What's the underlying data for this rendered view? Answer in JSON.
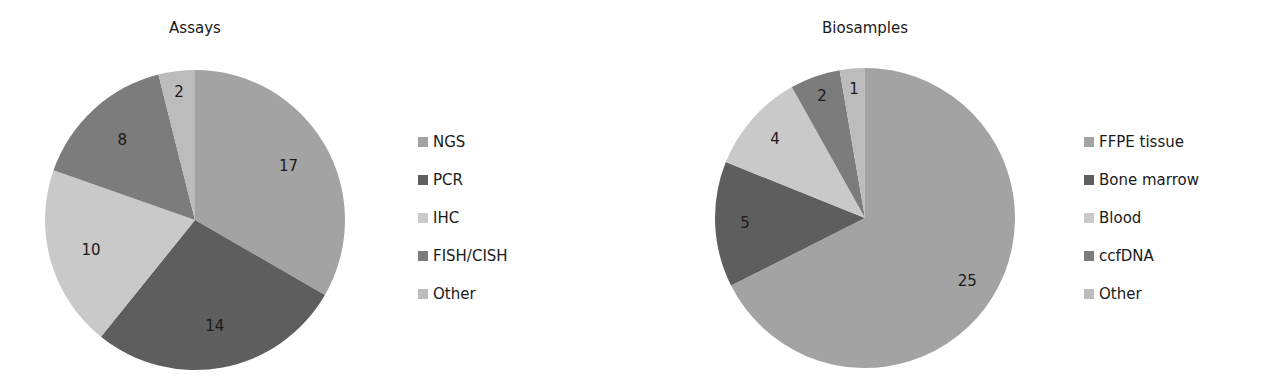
{
  "chart_data": [
    {
      "type": "pie",
      "title": "Assays",
      "categories": [
        "NGS",
        "PCR",
        "IHC",
        "FISH/CISH",
        "Other"
      ],
      "values": [
        17,
        14,
        10,
        8,
        2
      ],
      "colors": [
        "#a3a3a3",
        "#5e5e5e",
        "#c9c9c9",
        "#7c7c7c",
        "#bcbcbc"
      ],
      "start_angle_deg": 0,
      "direction": "clockwise",
      "data_labels": true,
      "legend_position": "right"
    },
    {
      "type": "pie",
      "title": "Biosamples",
      "categories": [
        "FFPE tissue",
        "Bone marrow",
        "Blood",
        "ccfDNA",
        "Other"
      ],
      "values": [
        25,
        5,
        4,
        2,
        1
      ],
      "colors": [
        "#a3a3a3",
        "#5e5e5e",
        "#c9c9c9",
        "#7c7c7c",
        "#bcbcbc"
      ],
      "start_angle_deg": 0,
      "direction": "clockwise",
      "data_labels": true,
      "legend_position": "right"
    }
  ]
}
